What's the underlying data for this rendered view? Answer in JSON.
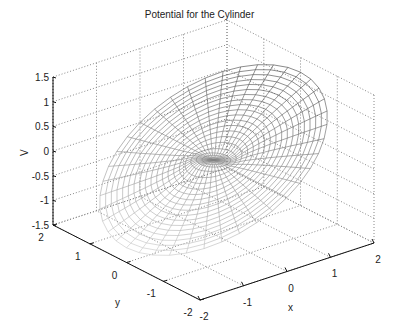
{
  "chart_data": {
    "type": "surface3d",
    "title": "Potential for the Cylinder",
    "xlabel": "x",
    "ylabel": "y",
    "zlabel": "V",
    "xlim": [
      -2,
      2
    ],
    "ylim": [
      -2,
      2
    ],
    "zlim": [
      -1.5,
      1.5
    ],
    "xticks": [
      "-2",
      "-1",
      "0",
      "1",
      "2"
    ],
    "yticks": [
      "-2",
      "-1",
      "0",
      "1",
      "2"
    ],
    "zticks": [
      "-1.5",
      "-1",
      "-0.5",
      "0",
      "0.5",
      "1",
      "1.5"
    ],
    "grid": true,
    "surface": {
      "description": "Polar mesh of potential V(r,theta) around a cylinder, radius 0 to 2, colored wireframe from dark (high) to light",
      "r_max": 2,
      "r_steps": 20,
      "theta_steps": 40,
      "mesh_color_dark": "#000000",
      "mesh_color_light": "#d8d8d8"
    }
  }
}
